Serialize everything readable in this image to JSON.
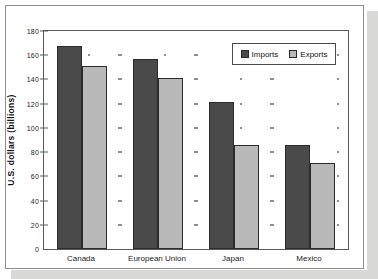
{
  "chart_data": {
    "type": "bar",
    "title": "",
    "subtitle": "",
    "xlabel": "",
    "ylabel": "U.S. dollars (billions)",
    "categories": [
      "Canada",
      "European Union",
      "Japan",
      "Mexico"
    ],
    "series": [
      {
        "name": "Imports",
        "color": "#4a4a4a",
        "values": [
          168,
          157,
          121,
          86
        ]
      },
      {
        "name": "Exports",
        "color": "#b9b9b9",
        "values": [
          151,
          141,
          86,
          71
        ]
      }
    ],
    "ylim": [
      0,
      180
    ],
    "ytick_step": 20,
    "yticks": [
      0,
      20,
      40,
      60,
      80,
      100,
      120,
      140,
      160,
      180
    ],
    "ytick_labels": [
      "0",
      "20",
      "40",
      "60",
      "80",
      "100",
      "120",
      "140",
      "160",
      "180"
    ],
    "grid": "dotted-markers",
    "legend_position": "top-right",
    "legend_entries": [
      "Imports",
      "Exports"
    ]
  }
}
